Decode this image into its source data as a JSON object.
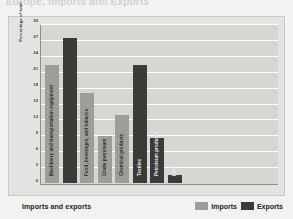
{
  "caption": {
    "text": "Europe: Imports and Exports"
  },
  "chart_data": {
    "type": "bar",
    "title": "",
    "xlabel": "Imports and exports",
    "ylabel": "Percentage of total",
    "ylim": [
      0,
      30
    ],
    "yticks": [
      30,
      27,
      24,
      21,
      18,
      15,
      12,
      9,
      6,
      3,
      0
    ],
    "grid": true,
    "legend_position": "bottom-right",
    "categories": [
      "Machinery and transportation equipment",
      "Food, beverages, and tobacco",
      "Crude petroleum",
      "Chemical products",
      "Textiles",
      "Petroleum products",
      "Furs"
    ],
    "series": [
      {
        "name": "Imports",
        "color": "#9d9d9a",
        "values": [
          22.5,
          17,
          9,
          13,
          null,
          null,
          null
        ]
      },
      {
        "name": "Exports",
        "color": "#3a3a38",
        "values": [
          27.5,
          null,
          null,
          null,
          22.5,
          8.5,
          1.5
        ]
      }
    ],
    "bars": [
      {
        "label": "Machinery and transportation equipment",
        "value": 22.5,
        "series": "Imports"
      },
      {
        "label": "",
        "value": 27.5,
        "series": "Exports"
      },
      {
        "label": "Food, beverages, and tobacco",
        "value": 17,
        "series": "Imports"
      },
      {
        "label": "Crude petroleum",
        "value": 9,
        "series": "Imports"
      },
      {
        "label": "Chemical products",
        "value": 13,
        "series": "Imports"
      },
      {
        "label": "Textiles",
        "value": 22.5,
        "series": "Exports"
      },
      {
        "label": "Petroleum products",
        "value": 8.5,
        "series": "Exports"
      },
      {
        "label": "Furs",
        "value": 1.5,
        "series": "Exports"
      }
    ]
  },
  "legend": {
    "imports_label": "Imports",
    "exports_label": "Exports"
  },
  "colors": {
    "imports": "#9d9d9a",
    "exports": "#3a3a38",
    "plot_background": "#d6d6d3",
    "figure_background": "#e3e3e1",
    "gridline": "#ffffff",
    "axis": "#8f8f8c"
  }
}
